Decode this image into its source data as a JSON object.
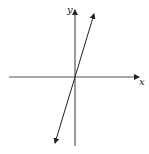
{
  "diagram": {
    "type": "coordinate-plane-line",
    "axes": {
      "x_label": "x",
      "y_label": "y"
    },
    "line": {
      "description": "straight line through the origin with positive slope (steep), arrows at both ends",
      "passes_through_origin": true
    },
    "colors": {
      "axis": "#555555",
      "line": "#222222",
      "background": "#ffffff"
    }
  }
}
